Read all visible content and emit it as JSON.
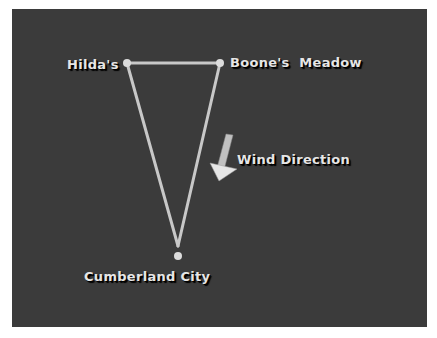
{
  "diagram": {
    "background_color": "#3b3b3b",
    "line_color": "#c8c8c8",
    "nodes": [
      {
        "id": "hildas",
        "label": "Hilda's",
        "x": 127,
        "y": 63
      },
      {
        "id": "boones-meadow",
        "label": "Boone's  Meadow",
        "x": 220,
        "y": 63
      },
      {
        "id": "cumberland-city",
        "label": "Cumberland City",
        "x": 178,
        "y": 256
      }
    ],
    "edges": [
      {
        "from": "hildas",
        "to": "boones-meadow"
      },
      {
        "from": "hildas",
        "to": "cumberland-city"
      },
      {
        "from": "boones-meadow",
        "to": "cumberland-city"
      }
    ],
    "arrow": {
      "label": "Wind Direction",
      "direction": "down-left"
    }
  }
}
